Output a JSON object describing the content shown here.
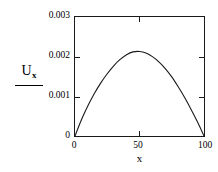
{
  "chart_data": {
    "type": "line",
    "title": "",
    "subtitle": "",
    "xlabel": "x",
    "ylabel": "U",
    "ylabel_subscript": "x",
    "ylabel_has_fraction_bar": true,
    "xlim": [
      0,
      100
    ],
    "ylim": [
      0,
      0.003
    ],
    "grid": false,
    "legend": null,
    "xticks": [
      0,
      50,
      100
    ],
    "xtick_labels": [
      "0",
      "50",
      "100"
    ],
    "yticks": [
      0,
      0.001,
      0.002,
      0.003
    ],
    "ytick_labels": [
      "0",
      "0.001",
      "0.002",
      "0.003"
    ],
    "series": [
      {
        "name": "Ux profile",
        "color": "#1a1a1a",
        "x": [
          0,
          5,
          10,
          15,
          20,
          25,
          30,
          35,
          40,
          45,
          50,
          55,
          60,
          65,
          70,
          75,
          80,
          85,
          90,
          95,
          100
        ],
        "y": [
          0.0,
          0.00041,
          0.00076,
          0.00107,
          0.00134,
          0.00157,
          0.00177,
          0.00193,
          0.00205,
          0.00212,
          0.00213,
          0.00209,
          0.002,
          0.00187,
          0.0017,
          0.00149,
          0.00124,
          0.00097,
          0.00067,
          0.00035,
          0.0
        ]
      }
    ],
    "peak": {
      "x": 50,
      "y": 0.00213
    },
    "endpoints": [
      {
        "x": 0,
        "y": 0
      },
      {
        "x": 100,
        "y": 0
      }
    ],
    "axis_color": "#1a1a1a",
    "background": "#ffffff"
  },
  "axis": {
    "y_label_numerator": "U",
    "y_label_subscript": "x",
    "x_label": "x",
    "y_tick_0": "0",
    "y_tick_1": "0.001",
    "y_tick_2": "0.002",
    "y_tick_3": "0.003",
    "x_tick_0": "0",
    "x_tick_1": "50",
    "x_tick_2": "100"
  }
}
